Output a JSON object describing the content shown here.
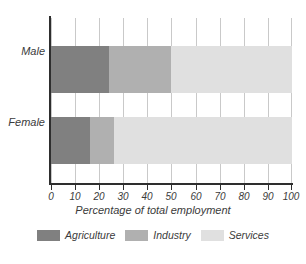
{
  "chart_data": {
    "type": "bar",
    "orientation": "horizontal",
    "stacked": true,
    "title": "",
    "subtitle": "",
    "xlabel": "Percentage of total employment",
    "ylabel": "",
    "xlim": [
      0,
      100
    ],
    "xticks": [
      0,
      10,
      20,
      30,
      40,
      50,
      60,
      70,
      80,
      90,
      100
    ],
    "xtick_labels": [
      "0",
      "10",
      "20",
      "30",
      "40",
      "50",
      "60",
      "70",
      "80",
      "90",
      "100"
    ],
    "categories": [
      "Male",
      "Female"
    ],
    "grid": "vertical",
    "legend_position": "bottom",
    "series": [
      {
        "name": "Agriculture",
        "color": "#808080",
        "values": [
          24,
          16
        ]
      },
      {
        "name": "Industry",
        "color": "#b0b0b0",
        "values": [
          26,
          10
        ]
      },
      {
        "name": "Services",
        "color": "#e0e0e0",
        "values": [
          50,
          74
        ]
      }
    ],
    "cumulative_boundaries": {
      "Male": [
        24,
        50,
        100
      ],
      "Female": [
        16,
        26,
        100
      ]
    },
    "annotations": []
  },
  "colors": {
    "agriculture": "#808080",
    "industry": "#b0b0b0",
    "services": "#e0e0e0",
    "axis": "#2e2e2e",
    "grid": "#c9c9c9",
    "text": "#3b3b3b",
    "background": "#ffffff"
  }
}
